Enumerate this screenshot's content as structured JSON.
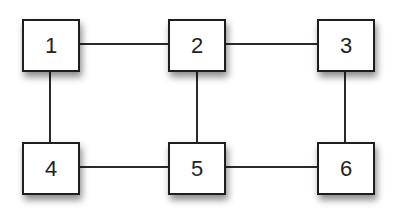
{
  "diagram": {
    "type": "grid-graph",
    "nodes": [
      {
        "id": "1",
        "label": "1",
        "row": 0,
        "col": 0
      },
      {
        "id": "2",
        "label": "2",
        "row": 0,
        "col": 1
      },
      {
        "id": "3",
        "label": "3",
        "row": 0,
        "col": 2
      },
      {
        "id": "4",
        "label": "4",
        "row": 1,
        "col": 0
      },
      {
        "id": "5",
        "label": "5",
        "row": 1,
        "col": 1
      },
      {
        "id": "6",
        "label": "6",
        "row": 1,
        "col": 2
      }
    ],
    "edges": [
      {
        "from": "1",
        "to": "2"
      },
      {
        "from": "2",
        "to": "3"
      },
      {
        "from": "4",
        "to": "5"
      },
      {
        "from": "5",
        "to": "6"
      },
      {
        "from": "1",
        "to": "4"
      },
      {
        "from": "2",
        "to": "5"
      },
      {
        "from": "3",
        "to": "6"
      }
    ],
    "colors": {
      "node_border": "#1e1e1e",
      "node_fill": "#ffffff",
      "edge": "#2a2a2a",
      "label": "#222222"
    }
  }
}
